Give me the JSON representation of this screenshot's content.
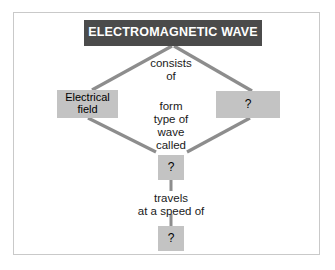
{
  "diagram": {
    "title": "ELECTROMAGNETIC WAVE",
    "frame": {
      "border_color": "#c9c9c9",
      "background": "#ffffff"
    },
    "colors": {
      "root_fill": "#4b4b4b",
      "root_text": "#ffffff",
      "node_fill": "#c3c3c3",
      "node_text": "#000000",
      "connector": "#8d8d8d"
    },
    "nodes": {
      "root": {
        "label": "ELECTROMAGNETIC WAVE"
      },
      "electrical_field": {
        "label": "Electrical\nfield"
      },
      "unknown_right": {
        "label": "?"
      },
      "unknown_wave": {
        "label": "?"
      },
      "unknown_speed": {
        "label": "?"
      }
    },
    "labels": {
      "consists_of": "consists\nof",
      "form_type_of_wave_called": "form\ntype of\nwave\ncalled",
      "travels_at_a_speed_of": "travels\nat a speed of"
    },
    "connectors": [
      {
        "name": "root-to-electrical-field",
        "from": "root",
        "to": "electrical_field"
      },
      {
        "name": "root-to-unknown-right",
        "from": "root",
        "to": "unknown_right"
      },
      {
        "name": "electrical-field-to-unknown-wave",
        "from": "electrical_field",
        "to": "unknown_wave"
      },
      {
        "name": "unknown-right-to-unknown-wave",
        "from": "unknown_right",
        "to": "unknown_wave"
      },
      {
        "name": "unknown-wave-to-unknown-speed",
        "from": "unknown_wave",
        "to": "unknown_speed"
      }
    ]
  }
}
